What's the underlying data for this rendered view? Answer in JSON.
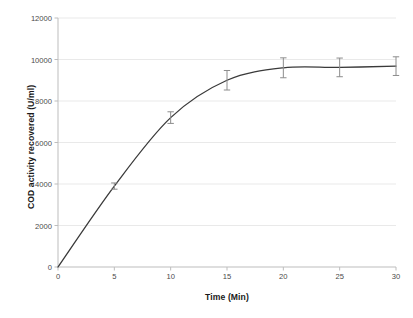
{
  "chart_data": {
    "type": "line",
    "title": "",
    "subtitle": "",
    "xlabel": "Time (Min)",
    "ylabel": "COD activity recovered (U/ml)",
    "xlim": [
      0,
      30
    ],
    "ylim": [
      0,
      12000
    ],
    "xticks": [
      0,
      5,
      10,
      15,
      20,
      25,
      30
    ],
    "yticks": [
      0,
      2000,
      4000,
      6000,
      8000,
      10000,
      12000
    ],
    "xtick_labels": [
      "0",
      "5",
      "10",
      "15",
      "20",
      "25",
      "30"
    ],
    "ytick_labels": [
      "0",
      "2000",
      "4000",
      "6000",
      "8000",
      "10000",
      "12000"
    ],
    "grid": "horizontal",
    "legend": "none",
    "annotations": [],
    "series": [
      {
        "name": "COD activity recovered",
        "x": [
          0,
          5,
          10,
          15,
          20,
          25,
          30
        ],
        "values": [
          0,
          3900,
          7200,
          9000,
          9600,
          9620,
          9680
        ],
        "yerr": [
          0,
          150,
          280,
          470,
          480,
          450,
          450
        ],
        "line_color": "#3a3a3a",
        "errorbar_color": "#8c8c8c",
        "marker": "none"
      }
    ],
    "colors": {
      "background": "#ffffff",
      "gridline": "#e9e9e9",
      "axis": "#bdbdbd",
      "tick_text": "#4a4a4a",
      "title_text": "#1a1a1a",
      "curve": "#3a3a3a",
      "errorbar": "#8c8c8c"
    },
    "plot_area": {
      "left": 58,
      "top": 18,
      "right": 396,
      "bottom": 267
    }
  }
}
